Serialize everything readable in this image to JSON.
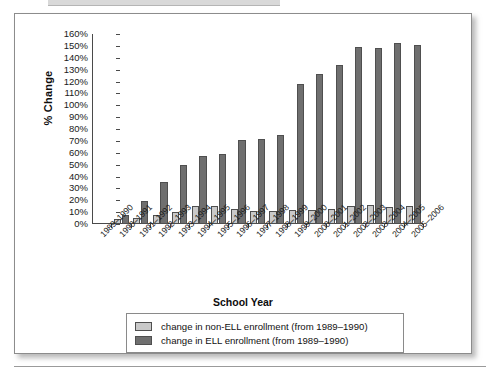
{
  "chart_data": {
    "type": "bar",
    "title": "",
    "xlabel": "School Year",
    "ylabel": "% Change",
    "ylim": [
      0,
      160
    ],
    "ytick_labels": [
      "160%",
      "150%",
      "140%",
      "130%",
      "120%",
      "110%",
      "100%",
      "90%",
      "80%",
      "70%",
      "60%",
      "50%",
      "40%",
      "30%",
      "20%",
      "10%",
      "0%"
    ],
    "ytick_values": [
      160,
      150,
      140,
      130,
      120,
      110,
      100,
      90,
      80,
      70,
      60,
      50,
      40,
      30,
      20,
      10,
      0
    ],
    "grid": false,
    "legend_position": "bottom",
    "categories": [
      "1989–1990",
      "1990–1991",
      "1991–1992",
      "1992–1993",
      "1993–1994",
      "1994–1995",
      "1995–1996",
      "1996–1997",
      "1997–1998",
      "1998–1999",
      "1999–2000",
      "2000–2001",
      "2001–2002",
      "2002–2003",
      "2003–2004",
      "2004–2005",
      "2005–2006"
    ],
    "series": [
      {
        "name": "change in non-ELL enrollment (from 1989–1990)",
        "color": "#c9c9c9",
        "values": [
          0,
          4.5,
          5,
          8,
          10,
          15.5,
          15,
          12.5,
          11,
          11,
          11.5,
          12,
          13,
          15.5,
          16,
          14.5,
          15
        ]
      },
      {
        "name": "change in ELL enrollment (from 1989–1990)",
        "color": "#6f6f6f",
        "values": [
          0,
          8,
          19.5,
          35,
          50,
          57,
          59,
          70.5,
          71.5,
          75,
          118,
          126,
          134,
          149,
          148,
          152.5,
          151
        ]
      }
    ]
  },
  "colors": {
    "non_ell": "#c9c9c9",
    "ell": "#6f6f6f",
    "axis": "#4a4a4a",
    "text": "#1a1a1a",
    "panel_border": "#8c8c8c"
  }
}
